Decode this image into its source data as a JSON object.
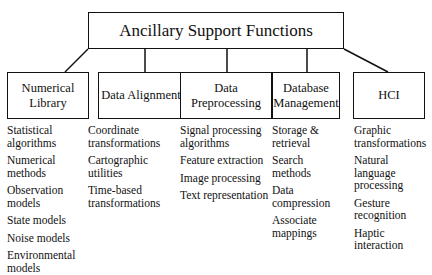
{
  "root": {
    "label": "Ancillary Support Functions"
  },
  "children": [
    {
      "label": "Numerical Library",
      "items": [
        "Statistical algorithms",
        "Numerical methods",
        "Observation models",
        "State models",
        "Noise models",
        "Environmental models"
      ]
    },
    {
      "label": "Data Alignment",
      "items": [
        "Coordinate transformations",
        "Cartographic utilities",
        "Time-based transformations"
      ]
    },
    {
      "label": "Data Preprocessing",
      "items": [
        "Signal processing algorithms",
        "Feature extraction",
        "Image processing",
        "Text representation"
      ]
    },
    {
      "label": "Database Management",
      "items": [
        "Storage & retrieval",
        "Search methods",
        "Data compression",
        "Associate mappings"
      ]
    },
    {
      "label": "HCI",
      "items": [
        "Graphic transformations",
        "Natural language processing",
        "Gesture recognition",
        "Haptic interaction"
      ]
    }
  ]
}
